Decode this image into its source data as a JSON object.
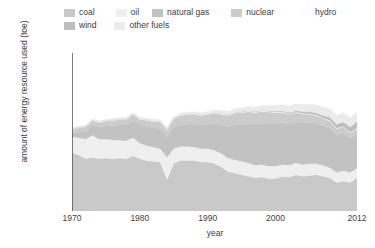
{
  "legend": {
    "rows": [
      [
        {
          "label": "coal",
          "color": "#c9c9c9"
        },
        {
          "label": "oil",
          "color": "#efefef"
        },
        {
          "label": "natural gas",
          "color": "#c2c2c2"
        },
        {
          "label": "nuclear",
          "color": "#cccccc"
        },
        {
          "label": "hydro",
          "color": "#fdfdfd"
        }
      ],
      [
        {
          "label": "wind",
          "color": "#bdbdbd"
        },
        {
          "label": "other fuels",
          "color": "#ebebeb"
        }
      ]
    ]
  },
  "axes": {
    "ylabel": "amount of energy resource used (toe)",
    "xlabel": "year",
    "yticks": [
      "0",
      "20 000",
      "40 000",
      "60 000",
      "80 000",
      "100 000"
    ],
    "ytick_values": [
      0,
      20000,
      40000,
      60000,
      80000,
      100000
    ],
    "xticks": [
      "1970",
      "1980",
      "1990",
      "2000",
      "2012"
    ],
    "xtick_values": [
      1970,
      1980,
      1990,
      2000,
      2012
    ]
  },
  "chart_data": {
    "type": "area",
    "title": "",
    "xlabel": "year",
    "ylabel": "amount of energy resource used (toe)",
    "xlim": [
      1970,
      2012
    ],
    "ylim": [
      0,
      100000
    ],
    "grid": false,
    "legend_position": "top",
    "stacked": true,
    "x": [
      1970,
      1971,
      1972,
      1973,
      1974,
      1975,
      1976,
      1977,
      1978,
      1979,
      1980,
      1981,
      1982,
      1983,
      1984,
      1985,
      1986,
      1987,
      1988,
      1989,
      1990,
      1991,
      1992,
      1993,
      1994,
      1995,
      1996,
      1997,
      1998,
      1999,
      2000,
      2001,
      2002,
      2003,
      2004,
      2005,
      2006,
      2007,
      2008,
      2009,
      2010,
      2011,
      2012
    ],
    "series": [
      {
        "name": "coal",
        "color": "#c9c9c9",
        "values": [
          37000,
          35500,
          33000,
          34000,
          33000,
          33500,
          33000,
          33500,
          33000,
          35000,
          33000,
          32000,
          31500,
          31000,
          20000,
          30000,
          32000,
          32000,
          32000,
          31000,
          31000,
          30000,
          28000,
          25000,
          24000,
          23000,
          22000,
          21000,
          21500,
          20500,
          20500,
          22000,
          21500,
          23000,
          22000,
          22500,
          23000,
          22000,
          21000,
          18000,
          19000,
          18000,
          21000
        ],
        "note": "pronounced dip in 1984 (miners' strike)"
      },
      {
        "name": "oil",
        "color": "#efefef",
        "values": [
          10000,
          11000,
          12500,
          14000,
          12500,
          12000,
          12000,
          11500,
          11500,
          11500,
          10000,
          9500,
          9000,
          8500,
          14000,
          9500,
          9000,
          9000,
          8500,
          8500,
          8500,
          8500,
          8500,
          8500,
          8500,
          8500,
          8500,
          8000,
          8000,
          8000,
          8000,
          7500,
          7500,
          7500,
          7500,
          7500,
          7000,
          7000,
          6500,
          6500,
          6500,
          6500,
          6000
        ]
      },
      {
        "name": "natural gas",
        "color": "#c2c2c2",
        "values": [
          2000,
          3500,
          5000,
          6500,
          7500,
          8500,
          9000,
          9500,
          10000,
          11000,
          11500,
          12000,
          12000,
          12500,
          13000,
          13500,
          13500,
          14000,
          14500,
          15000,
          15500,
          17000,
          18000,
          20000,
          22000,
          23000,
          25000,
          25500,
          26000,
          27000,
          27000,
          26500,
          26000,
          26000,
          26500,
          26000,
          25500,
          25000,
          25000,
          23500,
          24000,
          21500,
          22000
        ]
      },
      {
        "name": "nuclear",
        "color": "#cccccc",
        "values": [
          2500,
          2800,
          2800,
          2800,
          2800,
          3000,
          3200,
          3500,
          3500,
          3500,
          3500,
          4000,
          4200,
          4500,
          4500,
          5500,
          6000,
          6000,
          6000,
          6000,
          6000,
          6500,
          6800,
          7000,
          7500,
          7800,
          7500,
          7800,
          7500,
          7200,
          6800,
          6500,
          6200,
          5800,
          5500,
          5200,
          4800,
          4500,
          4500,
          4200,
          3800,
          3500,
          3200
        ]
      },
      {
        "name": "hydro",
        "color": "#fdfdfd",
        "values": [
          400,
          400,
          400,
          400,
          400,
          400,
          400,
          400,
          400,
          400,
          400,
          400,
          400,
          400,
          400,
          400,
          400,
          400,
          400,
          400,
          400,
          400,
          400,
          400,
          400,
          400,
          400,
          400,
          400,
          400,
          400,
          400,
          400,
          400,
          400,
          400,
          400,
          400,
          400,
          400,
          400,
          400,
          400
        ]
      },
      {
        "name": "wind",
        "color": "#bdbdbd",
        "values": [
          0,
          0,
          0,
          0,
          0,
          0,
          0,
          0,
          0,
          0,
          0,
          0,
          0,
          0,
          0,
          0,
          0,
          0,
          0,
          0,
          0,
          0,
          100,
          100,
          150,
          200,
          200,
          250,
          300,
          400,
          500,
          600,
          700,
          800,
          1000,
          1200,
          1400,
          1600,
          1900,
          2300,
          2600,
          3200,
          4000
        ]
      },
      {
        "name": "other fuels",
        "color": "#ebebeb",
        "values": [
          600,
          600,
          700,
          700,
          700,
          700,
          800,
          800,
          900,
          900,
          900,
          900,
          1000,
          1000,
          1000,
          1100,
          1200,
          1200,
          1300,
          1400,
          1500,
          1600,
          1800,
          2000,
          2200,
          2400,
          2600,
          2800,
          3000,
          3200,
          3500,
          3800,
          4000,
          4200,
          4500,
          4800,
          5000,
          5200,
          5400,
          5600,
          5800,
          6000,
          6200
        ]
      }
    ],
    "totals_note": "Total rises from about 62 000 in 1970 to a peak near 83 000 around 2005, then falls to about 70 000 by 2012."
  }
}
